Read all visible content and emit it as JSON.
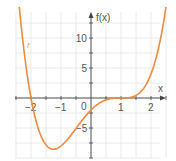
{
  "chart_data": {
    "type": "line",
    "title": "",
    "xlabel": "x",
    "ylabel": "f(x)",
    "xlim": [
      -2.5,
      2.5
    ],
    "ylim": [
      -9.5,
      14
    ],
    "grid": true,
    "x_ticks": [
      -2,
      -1,
      0,
      1,
      2
    ],
    "x_tick_labels": [
      "−2",
      "−1",
      "0",
      "1",
      "2"
    ],
    "y_ticks": [
      -5,
      5,
      10
    ],
    "y_tick_labels": [
      "−5",
      "5",
      "10"
    ],
    "series": [
      {
        "name": "f",
        "color": "#f08a3c",
        "formula": "f(x) = (x+2)(x-1)^3",
        "x": [
          -2.4,
          -2.2,
          -2.0,
          -1.8,
          -1.6,
          -1.4,
          -1.25,
          -1.0,
          -0.8,
          -0.6,
          -0.4,
          -0.2,
          0.0,
          0.2,
          0.4,
          0.6,
          0.8,
          1.0,
          1.2,
          1.4,
          1.6,
          1.8,
          2.0,
          2.2,
          2.4
        ],
        "values": [
          15.72,
          6.61,
          0.0,
          -3.93,
          -7.86,
          -8.29,
          -8.54,
          -8.0,
          -7.29,
          -5.73,
          -4.37,
          -3.14,
          -2.0,
          -1.12,
          -0.52,
          -0.17,
          -0.02,
          0.0,
          0.03,
          0.22,
          0.78,
          1.95,
          4.0,
          7.26,
          12.07
        ]
      }
    ],
    "legend": [],
    "annotations": [
      "f"
    ]
  },
  "labels": {
    "x_axis": "x",
    "y_axis": "f(x)",
    "function_name": "f",
    "origin": "0"
  },
  "colors": {
    "curve": "#f08a3c",
    "axis": "#444444",
    "grid": "#e4e4e4"
  }
}
